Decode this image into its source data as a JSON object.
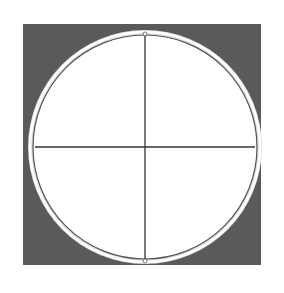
{
  "diagram": {
    "type": "circle-with-crosshair",
    "background_square": {
      "x": 23,
      "y": 24,
      "width": 238,
      "height": 241,
      "color": "#5a5a5a"
    },
    "circle": {
      "cx": 145,
      "cy": 147,
      "r": 115,
      "fill": "#ffffff",
      "rim_color": "#e8e8e8"
    },
    "crosshair": {
      "color": "#333333"
    },
    "endpoints": [
      "top",
      "bottom"
    ]
  }
}
